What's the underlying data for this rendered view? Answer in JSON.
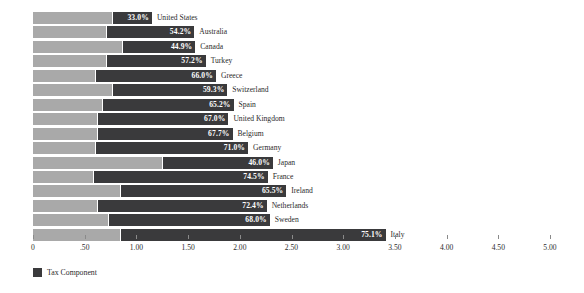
{
  "chart_data": {
    "type": "bar",
    "orientation": "horizontal",
    "stacked": true,
    "title": "",
    "xlabel": "",
    "ylabel": "",
    "xlim": [
      0,
      5.0
    ],
    "grid": false,
    "legend": {
      "position": "bottom-left",
      "entries": [
        {
          "name": "Tax Component",
          "color": "#3a3a3c"
        }
      ]
    },
    "axis_ticks": [
      "0",
      ".50",
      "1.00",
      "1.50",
      "2.00",
      "2.50",
      "3.00",
      "3.50",
      "4.00",
      "4.50",
      "5.00"
    ],
    "axis_tick_values": [
      0,
      0.5,
      1.0,
      1.5,
      2.0,
      2.5,
      3.0,
      3.5,
      4.0,
      4.5,
      5.0
    ],
    "categories": [
      "United States",
      "Australia",
      "Canada",
      "Turkey",
      "Greece",
      "Switzerland",
      "Spain",
      "United Kingdom",
      "Belgium",
      "Germany",
      "Japan",
      "France",
      "Ireland",
      "Netherlands",
      "Sweden",
      "Italy"
    ],
    "series": [
      {
        "name": "Base Component",
        "color": "#a9a9a9",
        "values": [
          0.76,
          0.71,
          0.86,
          0.71,
          0.6,
          0.76,
          0.67,
          0.62,
          0.62,
          0.6,
          1.25,
          0.58,
          0.84,
          0.62,
          0.73,
          0.84
        ]
      },
      {
        "name": "Tax Component",
        "color": "#3a3a3c",
        "values": [
          0.38,
          0.84,
          0.7,
          0.95,
          1.16,
          1.11,
          1.26,
          1.26,
          1.3,
          1.47,
          1.06,
          1.68,
          1.6,
          1.63,
          1.55,
          2.56
        ]
      }
    ],
    "bar_labels": [
      "33.0%",
      "54.2%",
      "44.9%",
      "57.2%",
      "66.0%",
      "59.3%",
      "65.2%",
      "67.0%",
      "67.7%",
      "71.0%",
      "46.0%",
      "74.5%",
      "65.5%",
      "72.4%",
      "68.0%",
      "75.1%"
    ],
    "bars": [
      {
        "category": "United States",
        "label": "33.0%",
        "base": 0.76,
        "tax": 0.38,
        "total": 1.14
      },
      {
        "category": "Australia",
        "label": "54.2%",
        "base": 0.71,
        "tax": 0.84,
        "total": 1.55
      },
      {
        "category": "Canada",
        "label": "44.9%",
        "base": 0.86,
        "tax": 0.7,
        "total": 1.56
      },
      {
        "category": "Turkey",
        "label": "57.2%",
        "base": 0.71,
        "tax": 0.95,
        "total": 1.66
      },
      {
        "category": "Greece",
        "label": "66.0%",
        "base": 0.6,
        "tax": 1.16,
        "total": 1.76
      },
      {
        "category": "Switzerland",
        "label": "59.3%",
        "base": 0.76,
        "tax": 1.11,
        "total": 1.87
      },
      {
        "category": "Spain",
        "label": "65.2%",
        "base": 0.67,
        "tax": 1.26,
        "total": 1.93
      },
      {
        "category": "United Kingdom",
        "label": "67.0%",
        "base": 0.62,
        "tax": 1.26,
        "total": 1.88
      },
      {
        "category": "Belgium",
        "label": "67.7%",
        "base": 0.62,
        "tax": 1.3,
        "total": 1.92
      },
      {
        "category": "Germany",
        "label": "71.0%",
        "base": 0.6,
        "tax": 1.47,
        "total": 2.07
      },
      {
        "category": "Japan",
        "label": "46.0%",
        "base": 1.25,
        "tax": 1.06,
        "total": 2.31
      },
      {
        "category": "France",
        "label": "74.5%",
        "base": 0.58,
        "tax": 1.68,
        "total": 2.26
      },
      {
        "category": "Ireland",
        "label": "65.5%",
        "base": 0.84,
        "tax": 1.6,
        "total": 2.44
      },
      {
        "category": "Netherlands",
        "label": "72.4%",
        "base": 0.62,
        "tax": 1.63,
        "total": 2.25
      },
      {
        "category": "Sweden",
        "label": "68.0%",
        "base": 0.73,
        "tax": 1.55,
        "total": 2.28
      },
      {
        "category": "Italy",
        "label": "75.1%",
        "base": 0.84,
        "tax": 2.56,
        "total": 3.4
      }
    ]
  },
  "colors": {
    "base": "#a9a9a9",
    "tax": "#3a3a3c",
    "text": "#2b2b2b",
    "value_text": "#ffffff",
    "tick": "#8a8a8a",
    "background": "#ffffff"
  }
}
